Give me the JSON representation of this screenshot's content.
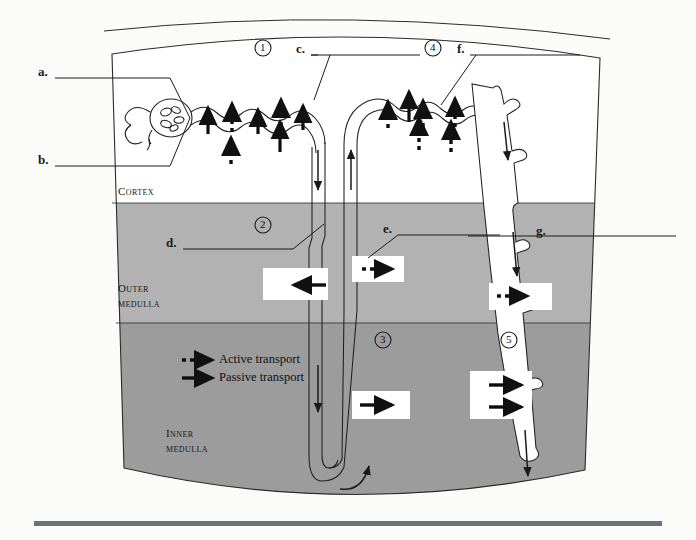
{
  "figure": {
    "background_color": "#fbfbf9",
    "outline_color": "#2b2b2b"
  },
  "zones": [
    {
      "id": "cortex",
      "label": "Cortex",
      "fill": "#ffffff",
      "y_top": 30,
      "y_bottom": 203
    },
    {
      "id": "outer-medulla",
      "label": "Outer\nmedulla",
      "fill": "#b0b0b0",
      "y_top": 203,
      "y_bottom": 323
    },
    {
      "id": "inner-medulla",
      "label": "Inner\nmedulla",
      "fill": "#9b9b9b",
      "y_top": 323,
      "y_bottom": 500
    }
  ],
  "zone_labels": [
    {
      "name": "cortex-label",
      "line1": "Cortex",
      "line2": "",
      "x": 118,
      "y": 191
    },
    {
      "name": "outer-medulla-label",
      "line1": "Outer",
      "line2": "medulla",
      "x": 118,
      "y": 288
    },
    {
      "name": "inner-medulla-label",
      "line1": "Inner",
      "line2": "medulla",
      "x": 166,
      "y": 433
    }
  ],
  "leader_labels": [
    {
      "key": "a",
      "letter": "a.",
      "letter_x": 38,
      "letter_y": 72,
      "line_x1": 55,
      "line_y1": 78,
      "line_x2": 168,
      "line_y2": 78,
      "pointer_x2": 168,
      "pointer_y2": 78
    },
    {
      "key": "b",
      "letter": "b.",
      "letter_x": 38,
      "letter_y": 160,
      "line_x1": 55,
      "line_y1": 166,
      "line_x2": 168,
      "line_y2": 166,
      "pointer_x2": 168,
      "pointer_y2": 166
    },
    {
      "key": "c",
      "letter": "c.",
      "letter_x": 296,
      "letter_y": 49,
      "line_x1": 311,
      "line_y1": 55,
      "line_x2": 418,
      "line_y2": 55,
      "pointer_x2": 316,
      "pointer_y2": 96
    },
    {
      "key": "d",
      "letter": "d.",
      "letter_x": 166,
      "letter_y": 243,
      "line_x1": 183,
      "line_y1": 249,
      "line_x2": 291,
      "line_y2": 249,
      "pointer_x2": 322,
      "pointer_y2": 227
    },
    {
      "key": "e",
      "letter": "e.",
      "letter_x": 383,
      "letter_y": 229,
      "line_x1": 398,
      "line_y1": 235,
      "line_x2": 496,
      "line_y2": 235,
      "pointer_x2": 368,
      "pointer_y2": 256
    },
    {
      "key": "f",
      "letter": "f.",
      "letter_x": 457,
      "letter_y": 49,
      "line_x1": 470,
      "line_y1": 55,
      "line_x2": 578,
      "line_y2": 55,
      "pointer_x2": 440,
      "pointer_y2": 101
    },
    {
      "key": "g",
      "letter": "g.",
      "letter_x": 536,
      "letter_y": 231,
      "line_x1": 551,
      "line_y1": 236,
      "line_x2": 672,
      "line_y2": 236,
      "pointer_x2": 470,
      "pointer_y2": 236
    }
  ],
  "circled_numbers": [
    {
      "value": "1",
      "x": 263,
      "y": 48
    },
    {
      "value": "2",
      "x": 263,
      "y": 225
    },
    {
      "value": "3",
      "x": 383,
      "y": 340
    },
    {
      "value": "4",
      "x": 433,
      "y": 48
    },
    {
      "value": "5",
      "x": 509,
      "y": 340
    }
  ],
  "legend": {
    "name": "transport-legend",
    "x": 180,
    "y": 355,
    "items": [
      {
        "key": "active",
        "label": "Active transport",
        "arrow_style": "dashed"
      },
      {
        "key": "passive",
        "label": "Passive transport",
        "arrow_style": "solid"
      }
    ]
  },
  "transport_arrows": {
    "proximal_tubule_active": 3,
    "proximal_tubule_passive": 4,
    "distal_tubule_active": 5,
    "distal_tubule_passive": 1,
    "medulla_markers": [
      {
        "name": "thin-descending-passive-out",
        "direction": "left",
        "style": "solid",
        "zone": "outer-medulla"
      },
      {
        "name": "thick-ascending-active-out",
        "direction": "right",
        "style": "dashed",
        "zone": "outer-medulla"
      },
      {
        "name": "collecting-duct-active-out",
        "direction": "right",
        "style": "dashed",
        "zone": "outer-medulla"
      },
      {
        "name": "thin-ascending-passive-out",
        "direction": "right",
        "style": "solid",
        "zone": "inner-medulla"
      },
      {
        "name": "collecting-duct-passive-1",
        "direction": "right",
        "style": "solid",
        "zone": "inner-medulla"
      },
      {
        "name": "collecting-duct-passive-2",
        "direction": "right",
        "style": "solid",
        "zone": "inner-medulla"
      }
    ]
  },
  "flow_arrows": [
    {
      "name": "descending-limb-flow",
      "direction": "down"
    },
    {
      "name": "ascending-limb-flow",
      "direction": "up"
    },
    {
      "name": "thin-descending-flow",
      "direction": "down"
    },
    {
      "name": "loop-bottom-flow",
      "direction": "up"
    },
    {
      "name": "collecting-duct-flow-upper",
      "direction": "down"
    },
    {
      "name": "collecting-duct-flow-mid",
      "direction": "down"
    },
    {
      "name": "collecting-duct-flow-lower",
      "direction": "down"
    }
  ],
  "footer_rule": {
    "name": "page-bottom-rule",
    "color": "#6f7178",
    "y": 521
  }
}
